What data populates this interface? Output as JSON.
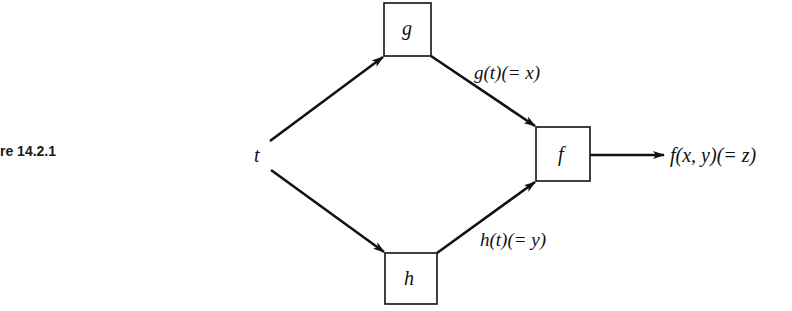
{
  "figure": {
    "caption": "re 14.2.1"
  },
  "diagram": {
    "input": "t",
    "nodes": [
      {
        "id": "g",
        "label": "g"
      },
      {
        "id": "h",
        "label": "h"
      },
      {
        "id": "f",
        "label": "f"
      }
    ],
    "edges": [
      {
        "from": "t",
        "to": "g",
        "label": ""
      },
      {
        "from": "t",
        "to": "h",
        "label": ""
      },
      {
        "from": "g",
        "to": "f",
        "label": "g(t)(= x)"
      },
      {
        "from": "h",
        "to": "f",
        "label": "h(t)(= y)"
      },
      {
        "from": "f",
        "to": "output",
        "label": "f(x, y)(= z)"
      }
    ],
    "labels": {
      "t": "t",
      "g_box": "g",
      "h_box": "h",
      "f_box": "f",
      "g_out": "g(t)(= x)",
      "h_out": "h(t)(= y)",
      "f_out": "f(x, y)(= z)"
    },
    "colors": {
      "stroke": "#111111",
      "background": "#ffffff"
    }
  }
}
